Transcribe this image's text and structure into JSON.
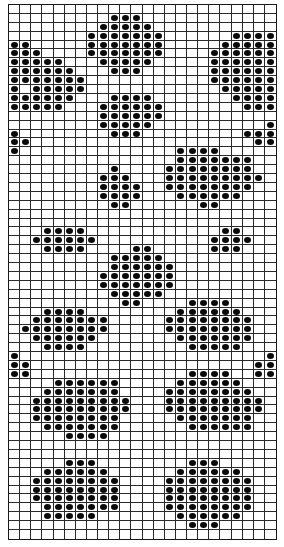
{
  "chart": {
    "title": "",
    "type": "stitch-chart",
    "columns": 24,
    "rows": 60,
    "symbol": "filled-dot",
    "colors": {
      "grid": "#2a2a2a",
      "dot": "#0a0a0a",
      "background": "#ffffff"
    },
    "filled": [
      [],
      [
        [
          9,
          11
        ]
      ],
      [
        [
          8,
          12
        ]
      ],
      [
        [
          7,
          13
        ],
        [
          20,
          23
        ]
      ],
      [
        [
          0,
          1
        ],
        [
          7,
          13
        ],
        [
          19,
          23
        ]
      ],
      [
        [
          0,
          2
        ],
        [
          7,
          13
        ],
        [
          18,
          23
        ]
      ],
      [
        [
          0,
          4
        ],
        [
          8,
          12
        ],
        [
          18,
          23
        ]
      ],
      [
        [
          0,
          5
        ],
        [
          9,
          11
        ],
        [
          18,
          23
        ]
      ],
      [
        [
          0,
          6
        ],
        [
          18,
          23
        ]
      ],
      [
        [
          0,
          0
        ],
        [
          2,
          6
        ],
        [
          19,
          23
        ]
      ],
      [
        [
          0,
          5
        ],
        [
          9,
          12
        ],
        [
          20,
          23
        ]
      ],
      [
        [
          0,
          4
        ],
        [
          8,
          13
        ],
        [
          21,
          23
        ]
      ],
      [
        [
          8,
          13
        ]
      ],
      [
        [
          8,
          12
        ],
        [
          23,
          23
        ]
      ],
      [
        [
          0,
          0
        ],
        [
          9,
          11
        ],
        [
          21,
          23
        ]
      ],
      [
        [
          0,
          1
        ],
        [
          22,
          23
        ]
      ],
      [
        [
          0,
          0
        ],
        [
          15,
          18
        ]
      ],
      [
        [
          15,
          21
        ]
      ],
      [
        [
          9,
          9
        ],
        [
          14,
          21
        ]
      ],
      [
        [
          8,
          10
        ],
        [
          14,
          22
        ]
      ],
      [
        [
          8,
          11
        ],
        [
          14,
          21
        ]
      ],
      [
        [
          8,
          11
        ],
        [
          15,
          20
        ]
      ],
      [
        [
          9,
          10
        ],
        [
          17,
          18
        ]
      ],
      [],
      [],
      [
        [
          3,
          6
        ],
        [
          19,
          20
        ]
      ],
      [
        [
          2,
          7
        ],
        [
          18,
          21
        ]
      ],
      [
        [
          3,
          6
        ],
        [
          11,
          12
        ],
        [
          18,
          20
        ]
      ],
      [
        [
          9,
          13
        ]
      ],
      [
        [
          9,
          14
        ]
      ],
      [
        [
          8,
          14
        ]
      ],
      [
        [
          8,
          14
        ]
      ],
      [
        [
          9,
          13
        ]
      ],
      [
        [
          10,
          11
        ],
        [
          16,
          19
        ]
      ],
      [
        [
          3,
          6
        ],
        [
          15,
          20
        ]
      ],
      [
        [
          2,
          8
        ],
        [
          14,
          21
        ]
      ],
      [
        [
          1,
          8
        ],
        [
          14,
          21
        ]
      ],
      [
        [
          2,
          7
        ],
        [
          15,
          21
        ]
      ],
      [
        [
          3,
          6
        ],
        [
          16,
          20
        ]
      ],
      [
        [
          0,
          0
        ],
        [
          23,
          23
        ]
      ],
      [
        [
          0,
          1
        ],
        [
          22,
          23
        ]
      ],
      [
        [
          0,
          1
        ],
        [
          16,
          19
        ],
        [
          22,
          23
        ]
      ],
      [
        [
          4,
          9
        ],
        [
          15,
          20
        ]
      ],
      [
        [
          3,
          9
        ],
        [
          14,
          21
        ]
      ],
      [
        [
          2,
          10
        ],
        [
          14,
          22
        ]
      ],
      [
        [
          2,
          10
        ],
        [
          14,
          22
        ]
      ],
      [
        [
          2,
          9
        ],
        [
          15,
          21
        ]
      ],
      [
        [
          3,
          9
        ],
        [
          16,
          21
        ]
      ],
      [
        [
          5,
          8
        ]
      ],
      [],
      [],
      [
        [
          5,
          7
        ],
        [
          16,
          18
        ]
      ],
      [
        [
          3,
          8
        ],
        [
          15,
          20
        ]
      ],
      [
        [
          2,
          9
        ],
        [
          14,
          21
        ]
      ],
      [
        [
          2,
          9
        ],
        [
          14,
          21
        ]
      ],
      [
        [
          2,
          9
        ],
        [
          14,
          21
        ]
      ],
      [
        [
          3,
          9
        ],
        [
          14,
          21
        ]
      ],
      [
        [
          3,
          7
        ],
        [
          15,
          20
        ]
      ],
      [
        [
          16,
          18
        ]
      ],
      []
    ]
  }
}
